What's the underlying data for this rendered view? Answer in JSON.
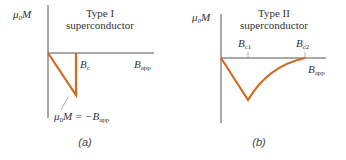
{
  "colors": {
    "curve": "#d2691e",
    "axis": "#555555",
    "text": "#333333"
  },
  "panel_a": {
    "title_line1": "Type I",
    "title_line2": "superconductor",
    "y_axis_label_mu": "μ",
    "y_axis_label_sub": "0",
    "y_axis_label_M": "M",
    "bc_label": "B",
    "bc_sub": "c",
    "x_axis_label": "B",
    "x_axis_sub": "app",
    "annotation_mu": "μ",
    "annotation_sub0": "0",
    "annotation_rest": "M = −B",
    "annotation_sub_app": "app",
    "caption": "(a)"
  },
  "panel_b": {
    "title_line1": "Type II",
    "title_line2": "superconductor",
    "y_axis_label_mu": "μ",
    "y_axis_label_sub": "0",
    "y_axis_label_M": "M",
    "bc1_label": "B",
    "bc1_sub": "c1",
    "bc2_label": "B",
    "bc2_sub": "c2",
    "x_axis_label": "B",
    "x_axis_sub": "app",
    "caption": "(b)"
  }
}
